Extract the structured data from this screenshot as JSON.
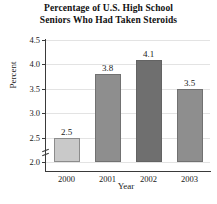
{
  "chart_data": {
    "type": "bar",
    "title": "Percentage of U.S. High School Seniors Who Had Taken Steroids",
    "title_lines": [
      "Percentage of U.S. High School",
      "Seniors Who Had Taken Steroids"
    ],
    "xlabel": "Year",
    "ylabel": "Percent",
    "categories": [
      "2000",
      "2001",
      "2002",
      "2003"
    ],
    "values": [
      2.5,
      3.8,
      4.1,
      3.5
    ],
    "value_labels": [
      "2.5",
      "3.8",
      "4.1",
      "3.5"
    ],
    "ylim": [
      2.0,
      4.5
    ],
    "y_axis_break": true,
    "yticks": [
      2.0,
      2.5,
      3.0,
      3.5,
      4.0,
      4.5
    ],
    "ytick_labels": [
      "2.0",
      "2.5",
      "3.0",
      "3.5",
      "4.0",
      "4.5"
    ],
    "grid": true,
    "legend": null,
    "bar_colors": [
      "#c9c9c9",
      "#8e8e8e",
      "#6f6f6f",
      "#8e8e8e"
    ],
    "axis_color": "#3a3a3a",
    "grid_color": "#e3e3e3",
    "background": "#ffffff"
  }
}
